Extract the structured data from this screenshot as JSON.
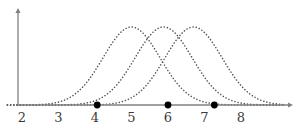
{
  "figure": {
    "name": "three-overlapping-bell-curves-with-marked-points",
    "background_color": "#ffffff",
    "width": 308,
    "height": 130
  },
  "axes": {
    "x_axis": {
      "name": "x-axis",
      "color": "#808080",
      "has_arrowhead": true,
      "baseline_y": 105,
      "start_x": 18,
      "end_x": 293
    },
    "y_axis": {
      "name": "y-axis",
      "color": "#808080",
      "has_arrowhead": true,
      "axis_x": 18,
      "top_y": 8,
      "bottom_y": 105
    },
    "tick_labels": [
      "2",
      "3",
      "4",
      "5",
      "6",
      "7",
      "8"
    ],
    "tick_label_color": "#3a3a3a"
  },
  "chart_data": {
    "type": "line",
    "title": "",
    "subtitle": "",
    "xlabel": "",
    "ylabel": "",
    "xlim": [
      1.6,
      9.2
    ],
    "ylim": [
      0,
      1.05
    ],
    "grid": false,
    "legend": "none",
    "x_ticks": [
      2,
      3,
      4,
      5,
      6,
      7,
      8
    ],
    "y_ticks": [],
    "line_style": "dotted",
    "curve_color": "#555555",
    "series": [
      {
        "name": "curve-1",
        "kind": "gaussian",
        "mean": 5.0,
        "sigma": 0.78,
        "peak_height": 1.0,
        "label": ""
      },
      {
        "name": "curve-2",
        "kind": "gaussian",
        "mean": 5.88,
        "sigma": 0.78,
        "peak_height": 1.0,
        "label": ""
      },
      {
        "name": "curve-3",
        "kind": "gaussian",
        "mean": 6.7,
        "sigma": 0.78,
        "peak_height": 1.0,
        "label": ""
      }
    ],
    "markers": [
      {
        "name": "marker-point-1",
        "x": 4.06,
        "y": 0,
        "color": "#000000",
        "radius": 3.4
      },
      {
        "name": "marker-point-2",
        "x": 6.0,
        "y": 0,
        "color": "#000000",
        "radius": 3.4
      },
      {
        "name": "marker-point-3",
        "x": 7.27,
        "y": 0,
        "color": "#000000",
        "radius": 3.4
      }
    ],
    "annotations": []
  }
}
